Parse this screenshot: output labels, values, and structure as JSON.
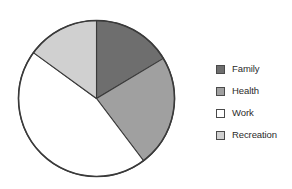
{
  "chart_data": {
    "type": "pie",
    "title": "",
    "categories": [
      "Family",
      "Health",
      "Work",
      "Recreation"
    ],
    "values": [
      16.4,
      23.3,
      45.3,
      15.0
    ],
    "units": "percent",
    "colors": [
      "#6e6e6e",
      "#a0a0a0",
      "#ffffff",
      "#d0d0d0"
    ],
    "start_angle_deg": 0,
    "direction": "clockwise",
    "slice_angles_deg": [
      59,
      84,
      163,
      54
    ],
    "outline_color": "#3a3a3a",
    "legend": {
      "position": "right",
      "entries": [
        {
          "label": "Family",
          "color": "#6e6e6e"
        },
        {
          "label": "Health",
          "color": "#a0a0a0"
        },
        {
          "label": "Work",
          "color": "#ffffff"
        },
        {
          "label": "Recreation",
          "color": "#d0d0d0"
        }
      ]
    },
    "grid": false,
    "xlabel": "",
    "ylabel": ""
  },
  "geometry": {
    "center_x": 96.5,
    "center_y": 98.5,
    "radius": 78
  }
}
